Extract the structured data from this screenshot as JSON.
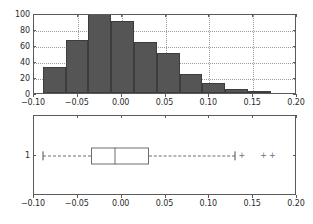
{
  "figure": {
    "background": "#ffffff",
    "width": 313,
    "height": 224
  },
  "chart_data": [
    {
      "type": "bar",
      "name": "histogram",
      "title": "",
      "xlabel": "",
      "ylabel": "",
      "xlim": [
        -0.1,
        0.2
      ],
      "ylim": [
        0,
        100
      ],
      "grid": true,
      "legend": false,
      "bar_color": "#555555",
      "bar_edge_color": "#3d3d3d",
      "xticks": [
        -0.1,
        -0.05,
        0.0,
        0.05,
        0.1,
        0.15,
        0.2
      ],
      "xticklabels": [
        "-0.10",
        "-0.05",
        "0.00",
        "0.05",
        "0.10",
        "0.15",
        "0.20"
      ],
      "yticks": [
        0,
        20,
        40,
        60,
        80,
        100
      ],
      "yticklabels": [
        "0",
        "20",
        "40",
        "60",
        "80",
        "100"
      ],
      "bin_edges": [
        -0.09,
        -0.064,
        -0.038,
        -0.012,
        0.014,
        0.04,
        0.066,
        0.092,
        0.118,
        0.144,
        0.17
      ],
      "categories": [
        "-0.090 to -0.064",
        "-0.064 to -0.038",
        "-0.038 to -0.012",
        "-0.012 to 0.014",
        "0.014 to 0.040",
        "0.040 to 0.066",
        "0.066 to 0.092",
        "0.092 to 0.118",
        "0.118 to 0.144",
        "0.144 to 0.170"
      ],
      "values": [
        32,
        66,
        100,
        90,
        64,
        50,
        24,
        13,
        5,
        2
      ]
    },
    {
      "type": "boxplot",
      "name": "boxplot",
      "title": "",
      "xlabel": "",
      "ylabel": "",
      "orientation": "horizontal",
      "xlim": [
        -0.1,
        0.2
      ],
      "grid": false,
      "legend": false,
      "xticks": [
        -0.1,
        -0.05,
        0.0,
        0.05,
        0.1,
        0.15,
        0.2
      ],
      "xticklabels": [
        "-0.10",
        "-0.05",
        "0.00",
        "0.05",
        "0.10",
        "0.15",
        "0.20"
      ],
      "yticks": [
        1
      ],
      "yticklabels": [
        "1"
      ],
      "boxes": [
        {
          "position_label": "1",
          "whisker_low": -0.09,
          "q1": -0.035,
          "median": -0.008,
          "q3": 0.031,
          "whisker_high": 0.129,
          "fliers": [
            0.137,
            0.162,
            0.172
          ],
          "flier_marker": "+",
          "box_edge_color": "#6e6e6e",
          "box_face_color": "#ffffff",
          "whisker_style": "dashed"
        }
      ]
    }
  ]
}
